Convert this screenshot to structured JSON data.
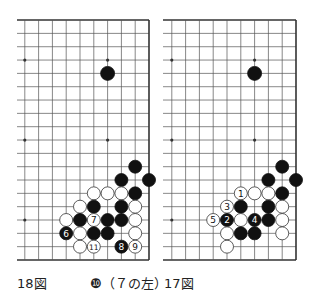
{
  "diagrams": [
    {
      "id": "left",
      "caption": "18図",
      "note": "❿（７の左）",
      "board": {
        "right_x": 149,
        "top_y": 20,
        "bottom_y": 260,
        "left_stub_x": 17,
        "col_spacing": 13.8,
        "row_spacing": 13.33,
        "cols_visible": 10,
        "rows_visible": 19
      },
      "star_points": [
        [
          3,
          15
        ],
        [
          9,
          15
        ],
        [
          3,
          9
        ],
        [
          9,
          9
        ],
        [
          3,
          3
        ],
        [
          9,
          3
        ]
      ],
      "stones": [
        {
          "c": 3,
          "r": 14,
          "color": "black",
          "label": ""
        },
        {
          "c": 1,
          "r": 7,
          "color": "black",
          "label": ""
        },
        {
          "c": 2,
          "r": 6,
          "color": "black",
          "label": ""
        },
        {
          "c": 0,
          "r": 6,
          "color": "black",
          "label": ""
        },
        {
          "c": 4,
          "r": 5,
          "color": "white",
          "label": ""
        },
        {
          "c": 3,
          "r": 5,
          "color": "white",
          "label": ""
        },
        {
          "c": 2,
          "r": 5,
          "color": "white",
          "label": ""
        },
        {
          "c": 1,
          "r": 5,
          "color": "black",
          "label": ""
        },
        {
          "c": 5,
          "r": 4,
          "color": "white",
          "label": ""
        },
        {
          "c": 4,
          "r": 4,
          "color": "black",
          "label": ""
        },
        {
          "c": 2,
          "r": 4,
          "color": "black",
          "label": ""
        },
        {
          "c": 1,
          "r": 4,
          "color": "white",
          "label": ""
        },
        {
          "c": 6,
          "r": 3,
          "color": "white",
          "label": ""
        },
        {
          "c": 5,
          "r": 3,
          "color": "black",
          "label": ""
        },
        {
          "c": 4,
          "r": 3,
          "color": "white",
          "label": "7"
        },
        {
          "c": 3,
          "r": 3,
          "color": "black",
          "label": ""
        },
        {
          "c": 2,
          "r": 3,
          "color": "black",
          "label": ""
        },
        {
          "c": 1,
          "r": 3,
          "color": "white",
          "label": ""
        },
        {
          "c": 6,
          "r": 2,
          "color": "black",
          "label": "6"
        },
        {
          "c": 5,
          "r": 2,
          "color": "white",
          "label": ""
        },
        {
          "c": 4,
          "r": 2,
          "color": "black",
          "label": ""
        },
        {
          "c": 3,
          "r": 2,
          "color": "black",
          "label": ""
        },
        {
          "c": 1,
          "r": 2,
          "color": "white",
          "label": ""
        },
        {
          "c": 5,
          "r": 1,
          "color": "white",
          "label": ""
        },
        {
          "c": 4,
          "r": 1,
          "color": "white",
          "label": "11"
        },
        {
          "c": 2,
          "r": 1,
          "color": "black",
          "label": "8"
        },
        {
          "c": 1,
          "r": 1,
          "color": "white",
          "label": "9"
        }
      ]
    },
    {
      "id": "right",
      "caption": "17図",
      "note": "",
      "board": {
        "right_x": 296,
        "top_y": 20,
        "bottom_y": 260,
        "left_stub_x": 163,
        "col_spacing": 13.8,
        "row_spacing": 13.33,
        "cols_visible": 10,
        "rows_visible": 19
      },
      "star_points": [
        [
          3,
          15
        ],
        [
          9,
          15
        ],
        [
          3,
          9
        ],
        [
          9,
          9
        ],
        [
          3,
          3
        ],
        [
          9,
          3
        ]
      ],
      "stones": [
        {
          "c": 3,
          "r": 14,
          "color": "black",
          "label": ""
        },
        {
          "c": 1,
          "r": 7,
          "color": "black",
          "label": ""
        },
        {
          "c": 2,
          "r": 6,
          "color": "black",
          "label": ""
        },
        {
          "c": 0,
          "r": 6,
          "color": "black",
          "label": ""
        },
        {
          "c": 4,
          "r": 5,
          "color": "white",
          "label": "1"
        },
        {
          "c": 3,
          "r": 5,
          "color": "white",
          "label": ""
        },
        {
          "c": 2,
          "r": 5,
          "color": "white",
          "label": ""
        },
        {
          "c": 1,
          "r": 5,
          "color": "black",
          "label": ""
        },
        {
          "c": 5,
          "r": 4,
          "color": "white",
          "label": "3"
        },
        {
          "c": 4,
          "r": 4,
          "color": "black",
          "label": ""
        },
        {
          "c": 2,
          "r": 4,
          "color": "black",
          "label": ""
        },
        {
          "c": 1,
          "r": 4,
          "color": "white",
          "label": ""
        },
        {
          "c": 6,
          "r": 3,
          "color": "white",
          "label": "5"
        },
        {
          "c": 5,
          "r": 3,
          "color": "black",
          "label": "2"
        },
        {
          "c": 4,
          "r": 3,
          "color": "white",
          "label": ""
        },
        {
          "c": 3,
          "r": 3,
          "color": "black",
          "label": "4"
        },
        {
          "c": 2,
          "r": 3,
          "color": "black",
          "label": ""
        },
        {
          "c": 1,
          "r": 3,
          "color": "white",
          "label": ""
        },
        {
          "c": 5,
          "r": 2,
          "color": "white",
          "label": ""
        },
        {
          "c": 4,
          "r": 2,
          "color": "black",
          "label": ""
        },
        {
          "c": 3,
          "r": 2,
          "color": "black",
          "label": ""
        },
        {
          "c": 1,
          "r": 2,
          "color": "white",
          "label": ""
        },
        {
          "c": 5,
          "r": 1,
          "color": "white",
          "label": ""
        }
      ]
    }
  ],
  "colors": {
    "line": "#555555",
    "edge": "#333333",
    "black_stone": "#111111",
    "white_stone": "#ffffff",
    "white_stroke": "#333333",
    "caption": "#222222"
  }
}
